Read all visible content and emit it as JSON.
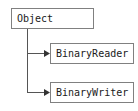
{
  "diagram": {
    "type": "class-inheritance",
    "title": "",
    "nodes": [
      {
        "id": "object",
        "label": "Object"
      },
      {
        "id": "binaryreader",
        "label": "BinaryReader"
      },
      {
        "id": "binarywriter",
        "label": "BinaryWriter"
      }
    ],
    "edges": [
      {
        "from": "object",
        "to": "binaryreader",
        "arrow": "arrowhead-right"
      },
      {
        "from": "object",
        "to": "binarywriter",
        "arrow": "arrowhead-right"
      }
    ],
    "colors": {
      "background": "#ffffff",
      "border": "#808080",
      "text": "#1a1a1a",
      "connector": "#555555"
    }
  }
}
